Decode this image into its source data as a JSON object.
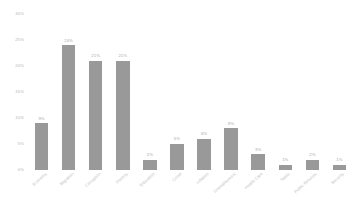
{
  "chart_data": {
    "type": "bar",
    "title": "",
    "subtitle": "",
    "xlabel": "",
    "ylabel": "",
    "grid": false,
    "legend": false,
    "orientation": "vertical",
    "bar_color": "#999999",
    "background_color": "#ffffff",
    "ylim": [
      0,
      30
    ],
    "y_ticks": [
      0,
      5,
      10,
      15,
      20,
      25,
      30
    ],
    "y_tick_labels": [
      "0%",
      "5%",
      "10%",
      "15%",
      "20%",
      "25%",
      "30%"
    ],
    "categories": [
      "Economy",
      "Migration",
      "Corruption",
      "Poverty",
      "Education",
      "Crime",
      "Inflation",
      "Unemployment",
      "Health Care",
      "Taxes",
      "Public Services",
      "Security"
    ],
    "values": [
      9,
      24,
      21,
      21,
      2,
      5,
      6,
      8,
      3,
      1,
      2,
      1
    ],
    "data_labels": [
      "9%",
      "24%",
      "21%",
      "21%",
      "2%",
      "5%",
      "6%",
      "8%",
      "3%",
      "1%",
      "2%",
      "1%"
    ],
    "annotations": []
  }
}
